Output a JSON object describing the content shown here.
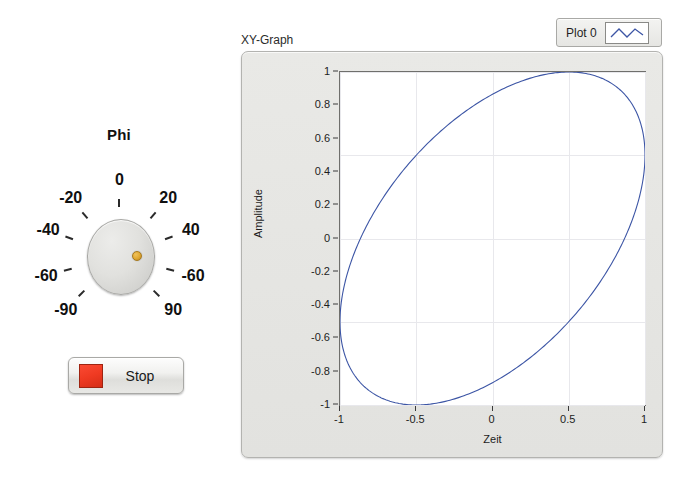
{
  "knob": {
    "title": "Phi",
    "name": "phi-knob",
    "value": 60,
    "min": -90,
    "max": 90,
    "pointer_color": "#e0a832",
    "tick_labels": [
      {
        "text": "-90",
        "angle": -135
      },
      {
        "text": "-60",
        "angle": -105
      },
      {
        "text": "-40",
        "angle": -70
      },
      {
        "text": "-20",
        "angle": -40
      },
      {
        "text": "0",
        "angle": 0
      },
      {
        "text": "20",
        "angle": 40
      },
      {
        "text": "40",
        "angle": 70
      },
      {
        "text": "-60",
        "angle": 105
      },
      {
        "text": "90",
        "angle": 135
      }
    ]
  },
  "stop_button": {
    "label": "Stop",
    "led_color": "#ef3a22"
  },
  "graph": {
    "title": "XY-Graph",
    "legend": {
      "label": "Plot 0",
      "line_color": "#3c55a5"
    }
  },
  "chart_data": {
    "type": "line",
    "title": "XY-Graph",
    "xlabel": "Zeit",
    "ylabel": "Amplitude",
    "xlim": [
      -1,
      1
    ],
    "ylim": [
      -1,
      1
    ],
    "grid": true,
    "legend_position": "top-right",
    "series_name": "Plot 0",
    "series_color": "#3c55a5",
    "parametric": {
      "x": "sin(t)",
      "y": "sin(t + phi)",
      "phi_degrees": 60,
      "t_range": [
        0,
        6.283185307179586
      ]
    },
    "xticks": [
      -1,
      -0.5,
      0,
      0.5,
      1
    ],
    "xtick_labels": [
      "-1",
      "-0.5",
      "0",
      "0.5",
      "1"
    ],
    "yticks": [
      1,
      0.8,
      0.6,
      0.4,
      0.2,
      0,
      -0.2,
      -0.4,
      -0.6,
      -0.8,
      -1
    ],
    "ytick_labels": [
      "1",
      "0.8",
      "0.6",
      "0.4",
      "0.2",
      "0",
      "-0.2",
      "-0.4",
      "-0.6",
      "-0.8",
      "-1"
    ],
    "points": [
      {
        "x": 0.0,
        "y": 0.866
      },
      {
        "x": 0.208,
        "y": 0.966
      },
      {
        "x": 0.407,
        "y": 1.0
      },
      {
        "x": 0.588,
        "y": 0.966
      },
      {
        "x": 0.743,
        "y": 0.866
      },
      {
        "x": 0.866,
        "y": 0.707
      },
      {
        "x": 0.951,
        "y": 0.5
      },
      {
        "x": 0.995,
        "y": 0.259
      },
      {
        "x": 0.995,
        "y": 0.0
      },
      {
        "x": 0.951,
        "y": -0.259
      },
      {
        "x": 0.866,
        "y": -0.5
      },
      {
        "x": 0.743,
        "y": -0.707
      },
      {
        "x": 0.588,
        "y": -0.866
      },
      {
        "x": 0.407,
        "y": -0.966
      },
      {
        "x": 0.208,
        "y": -1.0
      },
      {
        "x": 0.0,
        "y": -0.966
      },
      {
        "x": -0.208,
        "y": -0.866
      },
      {
        "x": -0.407,
        "y": -0.707
      },
      {
        "x": -0.588,
        "y": -0.5
      },
      {
        "x": -0.743,
        "y": -0.259
      },
      {
        "x": -0.866,
        "y": 0.0
      },
      {
        "x": -0.951,
        "y": 0.259
      },
      {
        "x": -0.995,
        "y": 0.5
      },
      {
        "x": -0.995,
        "y": 0.707
      },
      {
        "x": -0.951,
        "y": 0.866
      },
      {
        "x": -0.866,
        "y": 0.966
      },
      {
        "x": -0.743,
        "y": 1.0
      },
      {
        "x": -0.588,
        "y": 0.966
      },
      {
        "x": -0.407,
        "y": 0.866
      },
      {
        "x": -0.208,
        "y": 0.707
      }
    ]
  }
}
